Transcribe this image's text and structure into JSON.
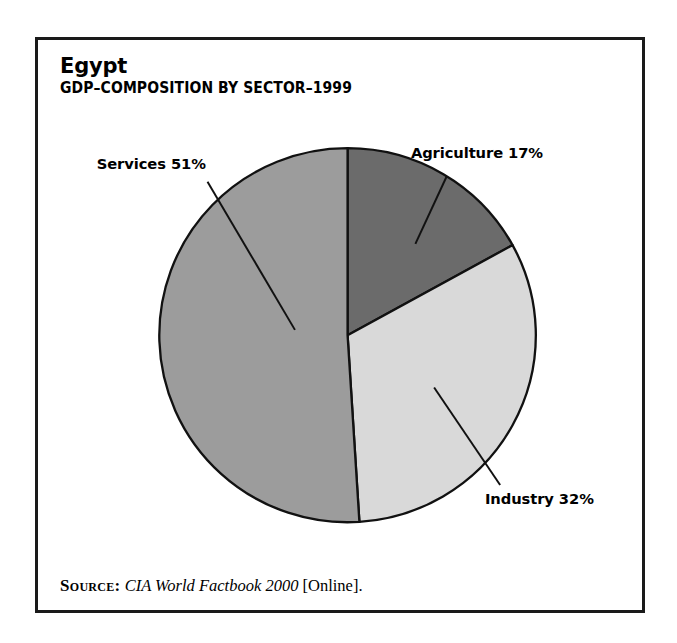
{
  "figure": {
    "title": "Egypt",
    "subtitle": "GDP–COMPOSITION BY SECTOR–1999",
    "source": {
      "keyword": "Source:",
      "title": "CIA World Factbook 2000",
      "tail": "[Online]."
    },
    "frame_color": "#1a1a1a"
  },
  "chart_data": {
    "type": "pie",
    "title": "GDP–COMPOSITION BY SECTOR–1999",
    "subject": "Egypt",
    "unit": "percent",
    "categories": [
      "Agriculture",
      "Industry",
      "Services"
    ],
    "values": [
      17,
      32,
      51
    ],
    "labels": [
      "Agriculture 17%",
      "Industry 32%",
      "Services 51%"
    ],
    "colors": [
      "#6b6b6b",
      "#d9d9d9",
      "#9c9c9c"
    ],
    "start_angle_deg": 0,
    "direction": "clockwise",
    "legend": "none",
    "grid": false,
    "slices": [
      {
        "name": "Agriculture",
        "value": 17,
        "label": "Agriculture 17%",
        "color": "#6b6b6b",
        "label_x": 492,
        "label_y": 133,
        "label_anchor": "middle",
        "leader": {
          "x1": 458,
          "y1": 154,
          "x2": 423,
          "y2": 230
        }
      },
      {
        "name": "Industry",
        "value": 32,
        "label": "Industry 32%",
        "color": "#d9d9d9",
        "label_x": 562,
        "label_y": 523,
        "label_anchor": "middle",
        "leader": {
          "x1": 518,
          "y1": 502,
          "x2": 444,
          "y2": 392
        }
      },
      {
        "name": "Services",
        "value": 51,
        "label": "Services 51%",
        "color": "#9c9c9c",
        "label_x": 127,
        "label_y": 146,
        "label_anchor": "middle",
        "leader": {
          "x1": 190,
          "y1": 160,
          "x2": 288,
          "y2": 327
        }
      }
    ],
    "geometry": {
      "center_x": 347,
      "center_y": 333,
      "radius": 211,
      "stroke": "#111111",
      "stroke_width": 2.6
    }
  }
}
